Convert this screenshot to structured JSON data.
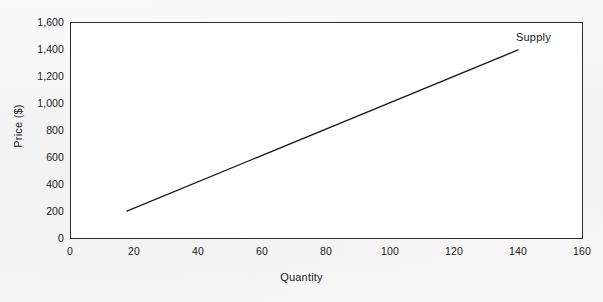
{
  "chart_data": {
    "type": "line",
    "title": "",
    "subtitle": "",
    "xlabel": "Quantity",
    "ylabel": "Price ($)",
    "xlim": [
      0,
      160
    ],
    "ylim": [
      0,
      1600
    ],
    "xticks": [
      "0",
      "20",
      "40",
      "60",
      "80",
      "100",
      "120",
      "140",
      "160"
    ],
    "xtick_values": [
      0,
      20,
      40,
      60,
      80,
      100,
      120,
      140,
      160
    ],
    "yticks": [
      "0",
      "200",
      "400",
      "600",
      "800",
      "1,000",
      "1,200",
      "1,400",
      "1,600"
    ],
    "ytick_values": [
      0,
      200,
      400,
      600,
      800,
      1000,
      1200,
      1400,
      1600
    ],
    "grid": false,
    "legend": "none",
    "annotations": [
      {
        "text": "Supply",
        "x": 140,
        "y": 1530
      }
    ],
    "series": [
      {
        "name": "Supply",
        "color": "#1a1a1a",
        "linewidth": 1.3,
        "x": [
          17.5,
          140
        ],
        "y": [
          200,
          1400
        ],
        "points": [
          {
            "quantity": 17.5,
            "price": 200
          },
          {
            "quantity": 140,
            "price": 1400
          }
        ]
      }
    ],
    "colors": {
      "line": "#1a1a1a",
      "axis": "#2b2b2b",
      "plot_background": "#ffffff",
      "figure_background": "#f6f6f6",
      "text": "#1a1a1a"
    }
  }
}
